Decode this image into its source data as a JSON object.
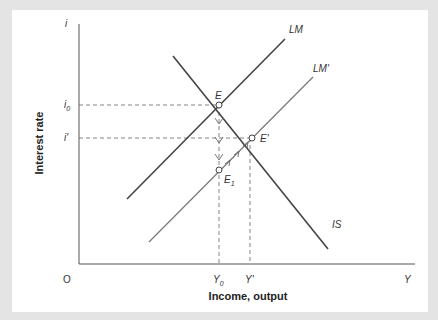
{
  "diagram": {
    "type": "IS-LM",
    "axes": {
      "y_axis_symbol": "i",
      "x_axis_symbol": "Y",
      "origin_label": "O",
      "y_axis_title": "Interest rate",
      "x_axis_title": "Income, output"
    },
    "curves": [
      {
        "id": "LM",
        "label": "LM",
        "style": "solid-dark"
      },
      {
        "id": "LMp",
        "label": "LM'",
        "style": "solid-gray"
      },
      {
        "id": "IS",
        "label": "IS",
        "style": "solid-dark"
      }
    ],
    "points": [
      {
        "id": "E",
        "label": "E"
      },
      {
        "id": "Ep",
        "label": "E'"
      },
      {
        "id": "E1",
        "label": "E",
        "subscript": "1"
      }
    ],
    "y_ticks": [
      {
        "label": "i",
        "subscript": "0"
      },
      {
        "label": "i'"
      }
    ],
    "x_ticks": [
      {
        "label": "Y",
        "subscript": "0"
      },
      {
        "label": "Y'"
      }
    ]
  }
}
